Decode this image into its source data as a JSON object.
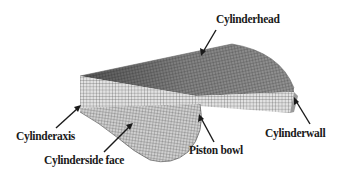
{
  "diagram": {
    "labels": {
      "cylinder_head": "Cylinderhead",
      "cylinder_axis": "Cylinderaxis",
      "cylinder_side_face": "Cylinderside face",
      "piston_bowl": "Piston bowl",
      "cylinder_wall": "Cylinderwall"
    },
    "colors": {
      "background": "#ffffff",
      "mesh_line": "#3a3a3a",
      "face_top": "#8a8a8a",
      "face_front": "#d8d8d8",
      "face_side": "#c8c8c8",
      "arrow": "#1a1a1a",
      "text": "#1a1a1a"
    }
  }
}
